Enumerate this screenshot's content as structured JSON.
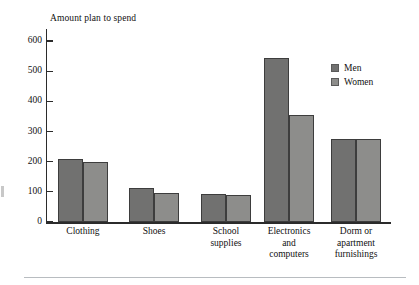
{
  "chart_data": {
    "type": "bar",
    "title": "Amount plan to spend",
    "xlabel": "",
    "ylabel": "Amount plan to spend",
    "ylim": [
      0,
      640
    ],
    "yticks": [
      0,
      100,
      200,
      300,
      400,
      500,
      600
    ],
    "ytick_labels": [
      "0",
      "100",
      "200",
      "300",
      "400",
      "500",
      "600"
    ],
    "grid": false,
    "legend_position": "top-right",
    "categories": [
      "Clothing",
      "Shoes",
      "School supplies",
      "Electronics and computers",
      "Dorm or apartment furnishings"
    ],
    "category_lines": [
      [
        "Clothing"
      ],
      [
        "Shoes"
      ],
      [
        "School",
        "supplies"
      ],
      [
        "Electronics",
        "and",
        "computers"
      ],
      [
        "Dorm or",
        "apartment",
        "furnishings"
      ]
    ],
    "series": [
      {
        "name": "Men",
        "color": "#717170",
        "values": [
          210,
          113,
          93,
          545,
          275
        ]
      },
      {
        "name": "Women",
        "color": "#8d8d8b",
        "values": [
          198,
          95,
          90,
          355,
          275
        ]
      }
    ]
  },
  "legend": {
    "items": [
      {
        "label": "Men"
      },
      {
        "label": "Women"
      }
    ]
  },
  "colors": {
    "men": "#717170",
    "women": "#8d8d8b",
    "axis": "#2b2b2b",
    "text": "#111111",
    "rule": "#b8bcc0"
  }
}
